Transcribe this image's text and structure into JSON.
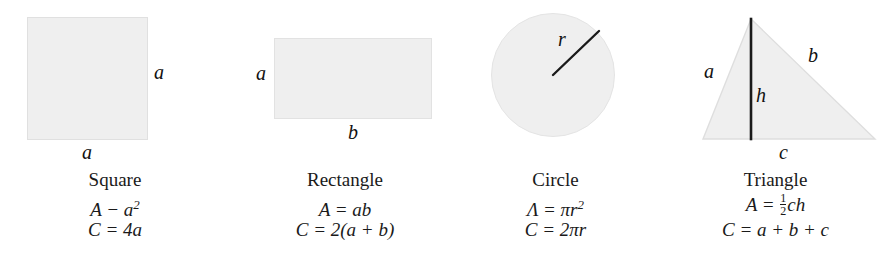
{
  "figure": {
    "background_color": "#ffffff",
    "shape_fill_color": "#efefef",
    "shape_stroke_color": "#cfcfcf",
    "line_color": "#1a1a1a",
    "panels": [
      {
        "key": "square",
        "name": "Square",
        "shape": "square",
        "area_formula": "A − a",
        "area_exponent": "2",
        "perimeter_formula": "C = 4a",
        "dimension_labels": [
          {
            "text": "a",
            "position": "right"
          },
          {
            "text": "a",
            "position": "bottom"
          }
        ]
      },
      {
        "key": "rectangle",
        "name": "Rectangle",
        "shape": "rectangle",
        "area_formula": "A = ab",
        "area_exponent": "",
        "perimeter_formula": "C = 2(a + b)",
        "dimension_labels": [
          {
            "text": "a",
            "position": "left"
          },
          {
            "text": "b",
            "position": "bottom"
          }
        ]
      },
      {
        "key": "circle",
        "name": "Circle",
        "shape": "circle",
        "area_formula": "Λ = πr",
        "area_exponent": "2",
        "perimeter_formula": "C = 2πr",
        "dimension_labels": [
          {
            "text": "r",
            "position": "radius"
          }
        ]
      },
      {
        "key": "triangle",
        "name": "Triangle",
        "shape": "triangle",
        "area_formula_prefix": "A = ",
        "area_fraction_numerator": "1",
        "area_fraction_denominator": "2",
        "area_formula_suffix": "ch",
        "perimeter_formula": "C = a + b + c",
        "dimension_labels": [
          {
            "text": "a",
            "position": "left-side"
          },
          {
            "text": "b",
            "position": "right-side"
          },
          {
            "text": "h",
            "position": "height"
          },
          {
            "text": "c",
            "position": "base"
          }
        ]
      }
    ]
  }
}
